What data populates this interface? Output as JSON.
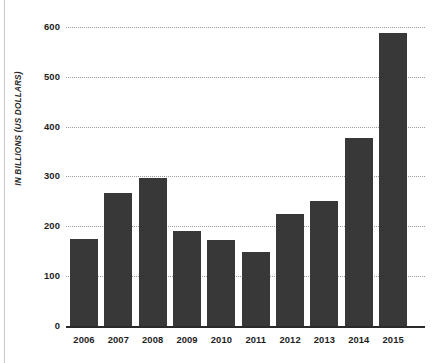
{
  "chart_data": {
    "type": "bar",
    "title": "",
    "subtitle": "",
    "xlabel": "",
    "ylabel": "IN BILLIONS (US DOLLARS)",
    "categories": [
      "2006",
      "2007",
      "2008",
      "2009",
      "2010",
      "2011",
      "2012",
      "2013",
      "2014",
      "2015"
    ],
    "values": [
      174,
      266,
      297,
      190,
      172,
      149,
      224,
      250,
      377,
      587
    ],
    "series": [
      {
        "name": "",
        "values": [
          174,
          266,
          297,
          190,
          172,
          149,
          224,
          250,
          377,
          587
        ]
      }
    ],
    "ylim": [
      0,
      600
    ],
    "yticks": [
      0,
      100,
      200,
      300,
      400,
      500,
      600
    ],
    "ytick_labels": [
      "0",
      "100",
      "200",
      "300",
      "400",
      "500",
      "600"
    ],
    "grid": true,
    "grid_style": "dotted",
    "legend": false,
    "legend_position": "none",
    "bar_color": "#383838",
    "grid_color": "#9b9b9b",
    "axis_color": "#2a2a2a",
    "background_color": "#ffffff",
    "annotations": []
  },
  "figure": {
    "y_axis_title": "IN BILLIONS (US DOLLARS)"
  }
}
